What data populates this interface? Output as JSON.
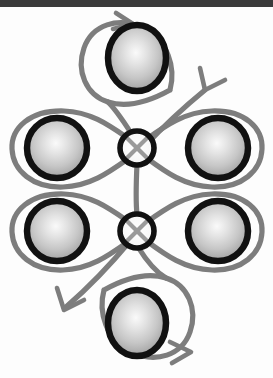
{
  "figure": {
    "title": "",
    "caption": "",
    "background_color": "#fdfdfd",
    "top_bar_color": "#3a3a3a",
    "curve_color": "#7d7d7d",
    "node_ring_color": "#111111",
    "sphere_ring_color": "#111111",
    "sphere_highlight_color": "#f2f2f2",
    "sphere_edge_color": "#8f8f8f"
  },
  "diagram": {
    "type": "knot-lobe-diagram",
    "node_count": 2,
    "sphere_count": 6,
    "arrow_count": 4,
    "nodes": [
      {
        "id": "node-upper",
        "label": "",
        "cx": 137,
        "cy": 148,
        "r": 17
      },
      {
        "id": "node-lower",
        "label": "",
        "cx": 137,
        "cy": 231,
        "r": 17
      }
    ],
    "spheres": [
      {
        "id": "sphere-top",
        "label": "",
        "cx": 137,
        "cy": 58,
        "rx": 29,
        "ry": 33
      },
      {
        "id": "sphere-upper-left",
        "label": "",
        "cx": 57,
        "cy": 148,
        "rx": 30,
        "ry": 30
      },
      {
        "id": "sphere-upper-right",
        "label": "",
        "cx": 218,
        "cy": 148,
        "rx": 30,
        "ry": 30
      },
      {
        "id": "sphere-lower-left",
        "label": "",
        "cx": 57,
        "cy": 231,
        "rx": 30,
        "ry": 30
      },
      {
        "id": "sphere-lower-right",
        "label": "",
        "cx": 218,
        "cy": 231,
        "rx": 30,
        "ry": 30
      },
      {
        "id": "sphere-bottom",
        "label": "",
        "cx": 137,
        "cy": 323,
        "rx": 29,
        "ry": 33
      }
    ],
    "arrows": [
      {
        "id": "arrow-top",
        "label": "",
        "direction": "right",
        "x": 120,
        "y": 20
      },
      {
        "id": "arrow-upper-right",
        "label": "",
        "direction": "down-left",
        "x": 204,
        "y": 85
      },
      {
        "id": "arrow-lower-left",
        "label": "",
        "direction": "down-left",
        "x": 62,
        "y": 313
      },
      {
        "id": "arrow-bottom",
        "label": "",
        "direction": "right",
        "x": 158,
        "y": 357
      }
    ],
    "lobes": [
      {
        "id": "lobe-upper-left",
        "label": "",
        "anchor": "node-upper",
        "side": "left"
      },
      {
        "id": "lobe-upper-right",
        "label": "",
        "anchor": "node-upper",
        "side": "right"
      },
      {
        "id": "lobe-lower-left",
        "label": "",
        "anchor": "node-lower",
        "side": "left"
      },
      {
        "id": "lobe-lower-right",
        "label": "",
        "anchor": "node-lower",
        "side": "right"
      },
      {
        "id": "loop-top",
        "label": "",
        "anchor": "node-upper",
        "side": "top"
      },
      {
        "id": "loop-bottom",
        "label": "",
        "anchor": "node-lower",
        "side": "bottom"
      }
    ],
    "connector": {
      "id": "connector-vertical",
      "label": "",
      "from": "node-upper",
      "to": "node-lower"
    }
  }
}
